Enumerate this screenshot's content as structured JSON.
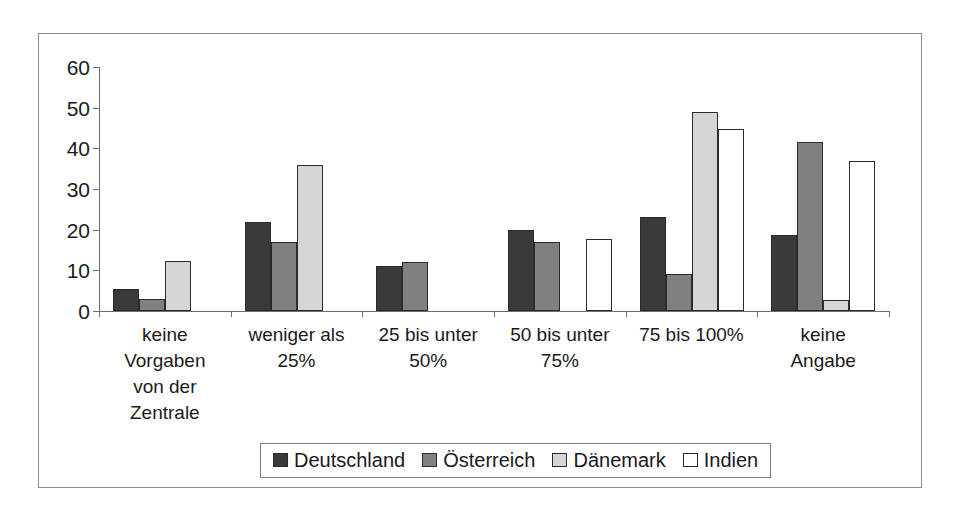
{
  "chart_data": {
    "type": "bar",
    "title": "",
    "subtitle": "",
    "xlabel": "",
    "ylabel": "",
    "ylim": [
      0,
      60
    ],
    "yticks": [
      0,
      10,
      20,
      30,
      40,
      50,
      60
    ],
    "ytick_labels": [
      "0",
      "10",
      "20",
      "30",
      "40",
      "50",
      "60"
    ],
    "grid": false,
    "legend_position": "bottom",
    "categories": [
      "keine Vorgaben von der Zentrale",
      "weniger als 25%",
      "25 bis unter 50%",
      "50 bis unter 75%",
      "75 bis 100%",
      "keine Angabe"
    ],
    "category_lines": [
      [
        "keine",
        "Vorgaben",
        "von der",
        "Zentrale"
      ],
      [
        "weniger als",
        "25%"
      ],
      [
        "25 bis unter",
        "50%"
      ],
      [
        "50 bis unter",
        "75%"
      ],
      [
        "75 bis 100%"
      ],
      [
        "keine",
        "Angabe"
      ]
    ],
    "series": [
      {
        "name": "Deutschland",
        "color": "#3a3a3a",
        "values": [
          5.3,
          22.0,
          11.0,
          20.0,
          23.0,
          18.7
        ]
      },
      {
        "name": "Österreich",
        "color": "#808080",
        "values": [
          3.0,
          17.0,
          12.0,
          17.0,
          9.0,
          41.5
        ]
      },
      {
        "name": "Dänemark",
        "color": "#d5d5d5",
        "values": [
          12.2,
          36.0,
          0,
          0,
          49.0,
          2.6
        ]
      },
      {
        "name": "Indien",
        "color": "#ffffff",
        "values": [
          0,
          0,
          0,
          17.8,
          44.8,
          36.8
        ]
      }
    ]
  }
}
